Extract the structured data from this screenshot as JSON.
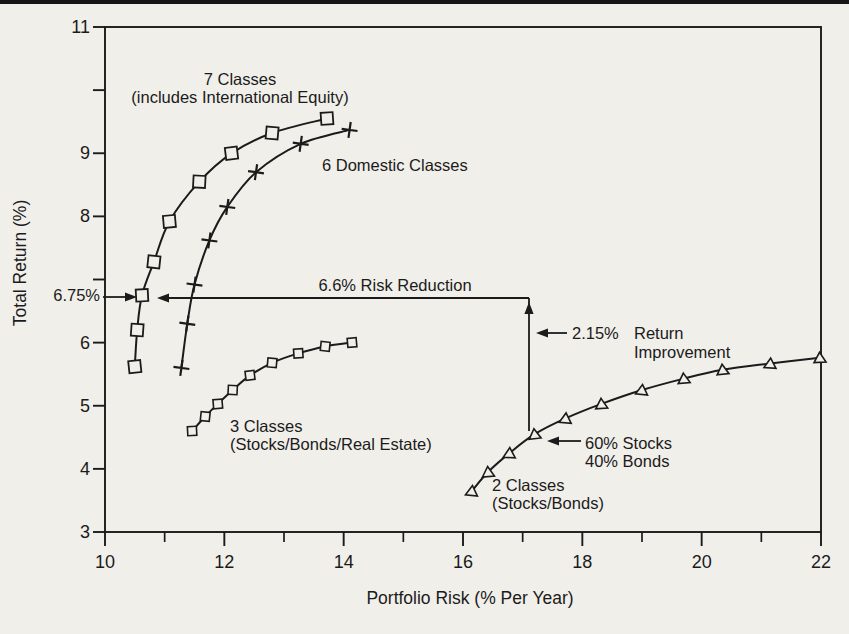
{
  "chart_data": {
    "type": "line",
    "title": "",
    "xlabel": "Portfolio Risk (% Per Year)",
    "ylabel": "Total Return (%)",
    "xlim": [
      10,
      22
    ],
    "ylim": [
      3,
      11
    ],
    "grid": false,
    "x_major_ticks": [
      10,
      12,
      14,
      16,
      18,
      20,
      22
    ],
    "x_minor_ticks": [
      11,
      13,
      15,
      17,
      19,
      21
    ],
    "y_ticks": [
      3,
      4,
      5,
      6,
      7,
      8,
      9,
      10,
      11
    ],
    "y_labeled_ticks": [
      3,
      4,
      5,
      6,
      8,
      9,
      11
    ],
    "series": [
      {
        "name": "7 Classes (includes International Equity)",
        "marker": "square",
        "label_lines": [
          "7 Classes",
          "(includes International Equity)"
        ],
        "points": [
          [
            10.5,
            5.62
          ],
          [
            10.54,
            6.2
          ],
          [
            10.62,
            6.75
          ],
          [
            10.82,
            7.28
          ],
          [
            11.08,
            7.92
          ],
          [
            11.58,
            8.55
          ],
          [
            12.12,
            9.0
          ],
          [
            12.8,
            9.32
          ],
          [
            13.72,
            9.55
          ]
        ]
      },
      {
        "name": "6 Domestic Classes",
        "marker": "plus",
        "label_lines": [
          "6 Domestic Classes"
        ],
        "points": [
          [
            11.28,
            5.6
          ],
          [
            11.38,
            6.3
          ],
          [
            11.5,
            6.92
          ],
          [
            11.75,
            7.62
          ],
          [
            12.05,
            8.15
          ],
          [
            12.53,
            8.7
          ],
          [
            13.28,
            9.15
          ],
          [
            14.1,
            9.37
          ]
        ]
      },
      {
        "name": "3 Classes (Stocks/Bonds/Real Estate)",
        "marker": "square-small",
        "label_lines": [
          "3 Classes",
          "(Stocks/Bonds/Real Estate)"
        ],
        "points": [
          [
            11.46,
            4.6
          ],
          [
            11.68,
            4.83
          ],
          [
            11.89,
            5.03
          ],
          [
            12.14,
            5.25
          ],
          [
            12.43,
            5.48
          ],
          [
            12.8,
            5.68
          ],
          [
            13.24,
            5.83
          ],
          [
            13.69,
            5.94
          ],
          [
            14.14,
            6.0
          ]
        ]
      },
      {
        "name": "2 Classes (Stocks/Bonds)",
        "marker": "triangle",
        "label_lines": [
          "2 Classes",
          "(Stocks/Bonds)"
        ],
        "points": [
          [
            16.15,
            3.65
          ],
          [
            16.42,
            3.95
          ],
          [
            16.78,
            4.25
          ],
          [
            17.2,
            4.55
          ],
          [
            17.72,
            4.8
          ],
          [
            18.32,
            5.03
          ],
          [
            19.0,
            5.25
          ],
          [
            19.7,
            5.43
          ],
          [
            20.35,
            5.57
          ],
          [
            21.15,
            5.67
          ],
          [
            21.98,
            5.76
          ]
        ]
      }
    ],
    "annotations": {
      "y_marker_label": "6.75%",
      "risk_reduction_label": "6.6% Risk Reduction",
      "return_improvement_value": "2.15%",
      "return_improvement_lines": [
        "Return",
        "Improvement"
      ],
      "mix_lines": [
        "60% Stocks",
        "40% Bonds"
      ]
    }
  }
}
